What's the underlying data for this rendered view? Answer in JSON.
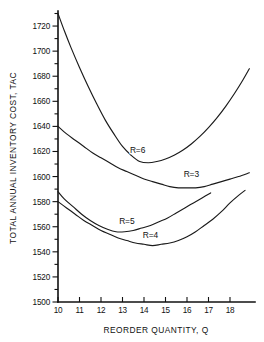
{
  "chart_data": {
    "type": "line",
    "title": "",
    "xlabel": "REORDER  QUANTITY, Q",
    "ylabel": "TOTAL ANNUAL INVENTORY COST, TAC",
    "xlim": [
      10,
      18.9
    ],
    "ylim": [
      1500,
      1732
    ],
    "grid": false,
    "legend_position": "inline-curve-labels",
    "xticks": [
      10,
      11,
      12,
      13,
      14,
      15,
      16,
      17,
      18
    ],
    "xtick_labels": [
      "10",
      "11",
      "12",
      "13",
      "14",
      "15",
      "16",
      "17",
      "18"
    ],
    "yticks": [
      1500,
      1510,
      1520,
      1530,
      1540,
      1550,
      1560,
      1570,
      1580,
      1590,
      1600,
      1610,
      1620,
      1630,
      1640,
      1650,
      1660,
      1670,
      1680,
      1690,
      1700,
      1710,
      1720,
      1730
    ],
    "ytick_labels_major": [
      "1500",
      "1520",
      "1540",
      "1560",
      "1580",
      "1600",
      "1620",
      "1640",
      "1660",
      "1680",
      "1700",
      "1720"
    ],
    "ytick_major_step": 20,
    "ytick_minor_step": 10,
    "series": [
      {
        "name": "R=6",
        "label": "R=6",
        "label_x": 13.7,
        "label_y": 1619,
        "x": [
          10.0,
          10.3,
          10.6,
          11.0,
          11.4,
          11.8,
          12.2,
          12.6,
          13.0,
          13.4,
          13.8,
          14.2,
          14.6,
          15.0,
          15.4,
          15.8,
          16.2,
          16.6,
          17.0,
          17.4,
          17.8,
          18.2,
          18.6,
          18.9
        ],
        "y": [
          1730,
          1716,
          1703,
          1687,
          1672,
          1658,
          1645,
          1634,
          1624,
          1617,
          1612,
          1611,
          1612,
          1614,
          1617,
          1621,
          1626,
          1632,
          1639,
          1647,
          1656,
          1666,
          1677,
          1686
        ]
      },
      {
        "name": "R=3",
        "label": "R=3",
        "label_x": 16.2,
        "label_y": 1600,
        "x": [
          10.0,
          10.4,
          10.8,
          11.2,
          11.6,
          12.0,
          12.4,
          12.8,
          13.2,
          13.6,
          14.0,
          14.4,
          14.8,
          15.2,
          15.6,
          16.0,
          16.4,
          16.8,
          17.2,
          17.6,
          18.0,
          18.4,
          18.9
        ],
        "y": [
          1640,
          1634,
          1629,
          1624,
          1619,
          1615,
          1611,
          1607,
          1604,
          1601,
          1598,
          1596,
          1594,
          1592,
          1591,
          1591,
          1591,
          1592,
          1594,
          1596,
          1598,
          1600,
          1603
        ]
      },
      {
        "name": "R=5",
        "label": "R=5",
        "label_x": 13.2,
        "label_y": 1562,
        "x": [
          10.0,
          10.3,
          10.7,
          11.1,
          11.5,
          11.9,
          12.3,
          12.7,
          13.1,
          13.5,
          13.9,
          14.3,
          14.7,
          15.1,
          15.5,
          15.9,
          16.3,
          16.7,
          17.1
        ],
        "y": [
          1588,
          1582,
          1576,
          1570,
          1565,
          1561,
          1558,
          1556,
          1556,
          1557,
          1559,
          1561,
          1564,
          1567,
          1571,
          1575,
          1579,
          1583,
          1587
        ]
      },
      {
        "name": "R=4",
        "label": "R=4",
        "label_x": 14.3,
        "label_y": 1551,
        "x": [
          10.0,
          10.4,
          10.8,
          11.2,
          11.6,
          12.0,
          12.4,
          12.8,
          13.2,
          13.6,
          14.0,
          14.4,
          14.8,
          15.2,
          15.6,
          16.0,
          16.4,
          16.8,
          17.2,
          17.6,
          18.0,
          18.4,
          18.7
        ],
        "y": [
          1580,
          1575,
          1570,
          1565,
          1561,
          1557,
          1554,
          1551,
          1549,
          1547,
          1546,
          1545,
          1546,
          1547,
          1549,
          1552,
          1556,
          1561,
          1566,
          1572,
          1579,
          1585,
          1589
        ]
      }
    ]
  }
}
